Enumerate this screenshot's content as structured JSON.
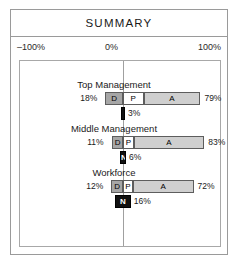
{
  "header": {
    "title": "SUMMARY"
  },
  "axis": {
    "left_label": "–100%",
    "center_label": "0%",
    "right_label": "100%"
  },
  "chart_data": {
    "type": "bar",
    "title": "SUMMARY",
    "xlabel": "",
    "ylabel": "",
    "xlim": [
      -100,
      100
    ],
    "grid": false,
    "legend": "none",
    "orientation": "horizontal",
    "stacked": true,
    "categories": [
      "Top Management",
      "Middle Management",
      "Workforce"
    ],
    "segment_keys": [
      "D",
      "P",
      "A",
      "N"
    ],
    "groups": [
      {
        "name": "Top Management",
        "left_total": "18%",
        "right_total": "79%",
        "left_value": 18,
        "right_value": 79,
        "segments": [
          {
            "key": "D",
            "label": "D",
            "value": 18,
            "side": "left",
            "style": "d"
          },
          {
            "key": "P",
            "label": "P",
            "value": 21,
            "side": "right",
            "style": "p"
          },
          {
            "key": "A",
            "label": "A",
            "value": 58,
            "side": "right",
            "style": "a"
          }
        ],
        "n_bar": {
          "label": "",
          "pct_text": "3%",
          "value": 3
        }
      },
      {
        "name": "Middle Management",
        "left_total": "11%",
        "right_total": "83%",
        "left_value": 11,
        "right_value": 83,
        "segments": [
          {
            "key": "D",
            "label": "D",
            "value": 11,
            "side": "left",
            "style": "d"
          },
          {
            "key": "P",
            "label": "P",
            "value": 11,
            "side": "right",
            "style": "p"
          },
          {
            "key": "A",
            "label": "A",
            "value": 72,
            "side": "right",
            "style": "a"
          }
        ],
        "n_bar": {
          "label": "N",
          "pct_text": "6%",
          "value": 6
        }
      },
      {
        "name": "Workforce",
        "left_total": "12%",
        "right_total": "72%",
        "left_value": 12,
        "right_value": 72,
        "segments": [
          {
            "key": "D",
            "label": "D",
            "value": 12,
            "side": "left",
            "style": "d"
          },
          {
            "key": "P",
            "label": "P",
            "value": 10,
            "side": "right",
            "style": "p"
          },
          {
            "key": "A",
            "label": "A",
            "value": 62,
            "side": "right",
            "style": "a"
          }
        ],
        "n_bar": {
          "label": "N",
          "pct_text": "16%",
          "value": 16
        }
      }
    ],
    "colors": {
      "segment_d": "#a6a6a6",
      "segment_p": "#ffffff",
      "segment_a": "#cfcfcf",
      "segment_n": "#111111",
      "frame": "#9a9a9a"
    }
  }
}
